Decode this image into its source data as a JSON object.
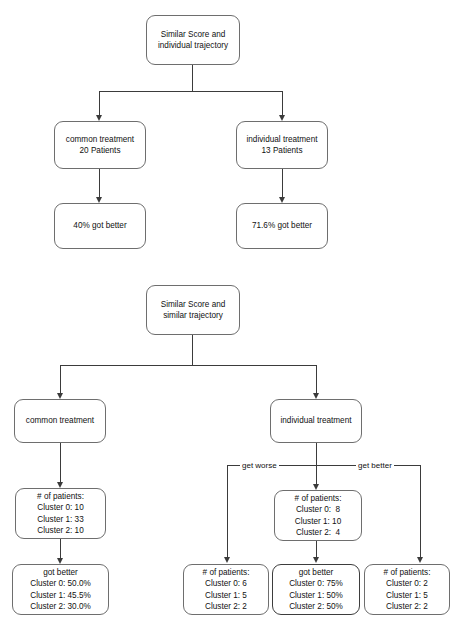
{
  "figure": {
    "colors": {
      "node_border": "#6e6e6e",
      "node_border_highlight": "#3d3d3d",
      "node_fill": "#ffffff",
      "edge": "#3b3b3b",
      "text": "#111111",
      "background": "#ffffff"
    }
  },
  "tree_individual": {
    "root": {
      "line1": "Similar Score and",
      "line2": "individual trajectory"
    },
    "left_branch": {
      "treatment": {
        "line1": "common treatment",
        "line2": "20 Patients"
      },
      "outcome": {
        "line1": "40% got better"
      }
    },
    "right_branch": {
      "treatment": {
        "line1": "individual treatment",
        "line2": "13 Patients"
      },
      "outcome": {
        "line1": "71.6% got better"
      }
    }
  },
  "tree_similar": {
    "root": {
      "line1": "Similar Score and",
      "line2": "similar trajectory"
    },
    "left_branch": {
      "treatment": {
        "line1": "common treatment"
      },
      "patients": {
        "header": "# of patients:",
        "row0": "Cluster 0: 10",
        "row1": "Cluster 1: 33",
        "row2": "Cluster 2: 10"
      },
      "got_better": {
        "header": "got better",
        "row0": "Cluster 0: 50.0%",
        "row1": "Cluster 1: 45.5%",
        "row2": "Cluster 2: 30.0%"
      }
    },
    "right_branch": {
      "treatment": {
        "line1": "individual treatment"
      },
      "edge_labels": {
        "get_worse": "get worse",
        "get_better": "get better"
      },
      "patients_total": {
        "header": "# of patients:",
        "row0": "Cluster 0:  8",
        "row1": "Cluster 1: 10",
        "row2": "Cluster 2:  4"
      },
      "get_worse_patients": {
        "header": "# of patients:",
        "row0": "Cluster 0: 6",
        "row1": "Cluster 1: 5",
        "row2": "Cluster 2: 2"
      },
      "got_better": {
        "header": "got better",
        "row0": "Cluster 0: 75%",
        "row1": "Cluster 1: 50%",
        "row2": "Cluster 2: 50%"
      },
      "get_better_patients": {
        "header": "# of patients:",
        "row0": "Cluster 0: 2",
        "row1": "Cluster 1: 5",
        "row2": "Cluster 2: 2"
      }
    }
  }
}
